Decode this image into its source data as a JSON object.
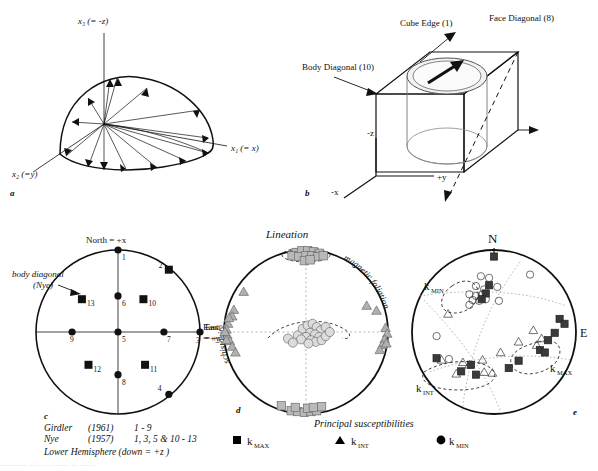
{
  "figure": {
    "panels": [
      "a",
      "b",
      "c",
      "d",
      "e"
    ]
  },
  "panel_a": {
    "letter": "a",
    "axis_vertical": "x₃ (= -z)",
    "axis_right": "x₁ (= x)",
    "axis_left": "x₂ (=y)",
    "description": "Hemispherical sector with radiating arrows from origin"
  },
  "panel_b": {
    "letter": "b",
    "label_cube_edge": "Cube Edge (1)",
    "label_face_diagonal": "Face Diagonal (8)",
    "label_body_diagonal": "Body Diagonal (10)",
    "axis_z": "-z",
    "axis_y": "+y",
    "axis_x": "-x"
  },
  "panel_c": {
    "letter": "c",
    "label_north": "North = +x",
    "label_east_line1": "East",
    "label_east_line2": "= +y",
    "annotation_line1": "body diagonal",
    "annotation_line2": "(Nye)",
    "caption": [
      {
        "name": "Girdler",
        "year": "(1961)",
        "range": "1 - 9"
      },
      {
        "name": "Nye",
        "year": "(1957)",
        "range": "1, 3, 5 &  10 - 13"
      }
    ],
    "hemisphere_note": "Lower Hemisphere (down = +z )",
    "points": [
      {
        "id": "1",
        "x": 0.0,
        "y": -1.0,
        "shape": "circle",
        "lx": 4,
        "ly": 10
      },
      {
        "id": "2",
        "x": 0.62,
        "y": -0.76,
        "shape": "square",
        "lx": -10,
        "ly": -2
      },
      {
        "id": "3",
        "x": 1.0,
        "y": 0.0,
        "shape": "circle",
        "lx": -4,
        "ly": 11
      },
      {
        "id": "4",
        "x": 0.62,
        "y": 0.76,
        "shape": "circle",
        "lx": -11,
        "ly": -3
      },
      {
        "id": "5",
        "x": 0.0,
        "y": 0.0,
        "shape": "circle",
        "lx": 4,
        "ly": 10
      },
      {
        "id": "6",
        "x": 0.0,
        "y": -0.44,
        "shape": "circle",
        "lx": 4,
        "ly": 10
      },
      {
        "id": "7",
        "x": 0.56,
        "y": 0.0,
        "shape": "circle",
        "lx": 3,
        "ly": 10
      },
      {
        "id": "8",
        "x": 0.0,
        "y": 0.52,
        "shape": "circle",
        "lx": 4,
        "ly": 10
      },
      {
        "id": "9",
        "x": -0.56,
        "y": 0.0,
        "shape": "circle",
        "lx": -2,
        "ly": 10
      },
      {
        "id": "10",
        "x": 0.31,
        "y": -0.4,
        "shape": "square",
        "lx": 5,
        "ly": 7
      },
      {
        "id": "11",
        "x": 0.33,
        "y": 0.4,
        "shape": "square",
        "lx": 5,
        "ly": 7
      },
      {
        "id": "12",
        "x": -0.36,
        "y": 0.4,
        "shape": "square",
        "lx": 5,
        "ly": 7
      },
      {
        "id": "13",
        "x": -0.44,
        "y": -0.4,
        "shape": "square",
        "lx": 5,
        "ly": 7
      }
    ]
  },
  "panel_d": {
    "letter": "d",
    "title": "Lineation",
    "label_schistosity": "schistosity",
    "label_magnetic_foliation": "magnetic foliation",
    "label_east_line1": "East",
    "label_east_line2": "= +y",
    "kmax": [
      {
        "x": -0.12,
        "y": -0.97
      },
      {
        "x": -0.05,
        "y": -0.99
      },
      {
        "x": 0.02,
        "y": -0.99
      },
      {
        "x": 0.09,
        "y": -0.98
      },
      {
        "x": 0.16,
        "y": -0.96
      },
      {
        "x": -0.17,
        "y": -0.93
      },
      {
        "x": -0.09,
        "y": -0.92
      },
      {
        "x": 0.0,
        "y": -0.93
      },
      {
        "x": 0.07,
        "y": -0.93
      },
      {
        "x": 0.14,
        "y": -0.92
      },
      {
        "x": 0.21,
        "y": -0.93
      },
      {
        "x": -0.02,
        "y": -0.87
      },
      {
        "x": 0.05,
        "y": -0.88
      },
      {
        "x": -0.3,
        "y": 0.9
      },
      {
        "x": -0.18,
        "y": 0.96
      },
      {
        "x": -0.1,
        "y": 0.97
      },
      {
        "x": -0.02,
        "y": 0.98
      },
      {
        "x": 0.06,
        "y": 0.97
      },
      {
        "x": 0.13,
        "y": 0.96
      },
      {
        "x": -0.13,
        "y": 0.92
      },
      {
        "x": 0.02,
        "y": 0.93
      },
      {
        "x": 0.09,
        "y": 0.92
      },
      {
        "x": 0.19,
        "y": 0.91
      }
    ],
    "kint": [
      {
        "x": -0.76,
        "y": -0.49
      },
      {
        "x": -0.88,
        "y": -0.27
      },
      {
        "x": -0.9,
        "y": -0.19
      },
      {
        "x": -0.95,
        "y": -0.1
      },
      {
        "x": -0.97,
        "y": -0.03
      },
      {
        "x": -0.96,
        "y": 0.04
      },
      {
        "x": -0.93,
        "y": 0.11
      },
      {
        "x": -0.97,
        "y": 0.1
      },
      {
        "x": -0.9,
        "y": 0.18
      },
      {
        "x": -0.86,
        "y": 0.25
      },
      {
        "x": -0.99,
        "y": 0.0
      },
      {
        "x": -0.94,
        "y": -0.17
      },
      {
        "x": 0.97,
        "y": -0.05
      },
      {
        "x": 0.99,
        "y": 0.02
      },
      {
        "x": 0.96,
        "y": 0.09
      },
      {
        "x": 0.93,
        "y": 0.16
      },
      {
        "x": 0.98,
        "y": 0.14
      },
      {
        "x": 0.9,
        "y": 0.22
      },
      {
        "x": 0.86,
        "y": -0.26
      },
      {
        "x": 0.74,
        "y": -0.32
      }
    ],
    "kmin": [
      {
        "x": -0.1,
        "y": 0.04
      },
      {
        "x": -0.04,
        "y": -0.04
      },
      {
        "x": 0.02,
        "y": -0.08
      },
      {
        "x": 0.08,
        "y": -0.1
      },
      {
        "x": 0.13,
        "y": -0.06
      },
      {
        "x": 0.18,
        "y": -0.02
      },
      {
        "x": 0.05,
        "y": 0.01
      },
      {
        "x": 0.11,
        "y": 0.03
      },
      {
        "x": 0.16,
        "y": 0.06
      },
      {
        "x": 0.0,
        "y": 0.06
      },
      {
        "x": -0.06,
        "y": 0.09
      },
      {
        "x": 0.06,
        "y": 0.1
      },
      {
        "x": 0.12,
        "y": 0.12
      },
      {
        "x": 0.19,
        "y": 0.1
      },
      {
        "x": 0.24,
        "y": 0.05
      },
      {
        "x": 0.24,
        "y": -0.06
      },
      {
        "x": -0.22,
        "y": 0.08
      },
      {
        "x": -0.16,
        "y": 0.13
      },
      {
        "x": 0.03,
        "y": 0.14
      },
      {
        "x": 0.29,
        "y": 0.0
      }
    ]
  },
  "panel_e": {
    "letter": "e",
    "label_north": "N",
    "label_east": "E",
    "label_kmin": "k",
    "label_kmin_sub": "MIN",
    "label_kint": "k",
    "label_kint_sub": "INT",
    "label_kmax": "k",
    "label_kmax_sub": "MAX",
    "kmax": [
      {
        "x": 0.0,
        "y": -0.92
      },
      {
        "x": -0.06,
        "y": -0.57
      },
      {
        "x": -0.1,
        "y": -0.47
      },
      {
        "x": -0.15,
        "y": -0.4
      },
      {
        "x": 0.8,
        "y": -0.16
      },
      {
        "x": 0.86,
        "y": -0.1
      },
      {
        "x": 0.74,
        "y": 0.01
      },
      {
        "x": 0.66,
        "y": 0.1
      },
      {
        "x": 0.56,
        "y": 0.22
      },
      {
        "x": 0.62,
        "y": 0.25
      },
      {
        "x": 0.3,
        "y": 0.35
      },
      {
        "x": 0.18,
        "y": 0.44
      },
      {
        "x": -0.28,
        "y": 0.4
      },
      {
        "x": -0.7,
        "y": 0.32
      },
      {
        "x": -0.4,
        "y": 0.48
      },
      {
        "x": -0.22,
        "y": 0.52
      }
    ],
    "kint": [
      {
        "x": -0.56,
        "y": -0.22
      },
      {
        "x": -0.14,
        "y": 0.34
      },
      {
        "x": 0.08,
        "y": 0.25
      },
      {
        "x": 0.3,
        "y": 0.12
      },
      {
        "x": 0.48,
        "y": -0.02
      },
      {
        "x": 0.58,
        "y": 0.08
      },
      {
        "x": 0.52,
        "y": 0.16
      },
      {
        "x": -0.64,
        "y": 0.34
      },
      {
        "x": -0.3,
        "y": 0.4
      },
      {
        "x": -0.46,
        "y": 0.51
      },
      {
        "x": -0.12,
        "y": 0.49
      },
      {
        "x": -0.02,
        "y": 0.5
      },
      {
        "x": -0.38,
        "y": 0.37
      }
    ],
    "kmin": [
      {
        "x": -0.16,
        "y": -0.68
      },
      {
        "x": -0.06,
        "y": -0.66
      },
      {
        "x": 0.44,
        "y": -0.7
      },
      {
        "x": -0.22,
        "y": -0.56
      },
      {
        "x": -0.12,
        "y": -0.52
      },
      {
        "x": 0.04,
        "y": -0.55
      },
      {
        "x": -0.3,
        "y": -0.46
      },
      {
        "x": -0.22,
        "y": -0.44
      },
      {
        "x": -0.14,
        "y": -0.46
      },
      {
        "x": -0.26,
        "y": -0.39
      },
      {
        "x": -0.18,
        "y": -0.38
      },
      {
        "x": -0.1,
        "y": -0.4
      },
      {
        "x": -0.3,
        "y": -0.33
      },
      {
        "x": 0.06,
        "y": -0.38
      },
      {
        "x": -0.7,
        "y": 0.05
      },
      {
        "x": -0.55,
        "y": 0.33
      }
    ]
  },
  "legend": {
    "title": "Principal susceptibilities",
    "items": [
      {
        "symbol": "square",
        "label": "k",
        "sub": "MAX",
        "color": "#b9b9b9"
      },
      {
        "symbol": "triangle",
        "label": "k",
        "sub": "INT",
        "color": "#b0b0b0"
      },
      {
        "symbol": "circle",
        "label": "k",
        "sub": "MIN",
        "color": "#d4d4d4"
      }
    ]
  },
  "colors": {
    "ink": "#111111",
    "kmax_fill": "#b9b9b9",
    "kint_fill": "#b0b0b0",
    "kmin_fill": "#dcdcdc",
    "symbol_stroke": "#6e6e6e",
    "dark_symbol": "#3a3a3a"
  },
  "bottom_caption": "................ ...... .. .... ......... .... ........."
}
